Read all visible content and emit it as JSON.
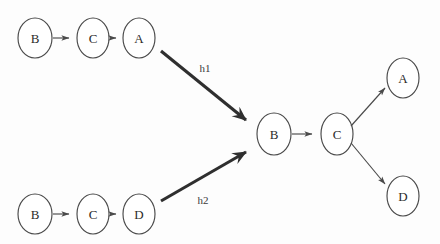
{
  "figure": {
    "background_color": "#fdfdfd",
    "stroke_color": "#4a4a4a",
    "thick_stroke_color": "#2f2f2f",
    "label_color": "#2b2b2b"
  },
  "graphs": {
    "source_top": {
      "name": "top-source-graph",
      "nodes": [
        {
          "id": "t1",
          "label": "B",
          "cx": 35,
          "cy": 38,
          "rx": 17,
          "ry": 20
        },
        {
          "id": "t2",
          "label": "C",
          "cx": 93,
          "cy": 38,
          "rx": 16,
          "ry": 20
        },
        {
          "id": "t3",
          "label": "A",
          "cx": 139,
          "cy": 38,
          "rx": 16,
          "ry": 20
        }
      ],
      "edges": [
        {
          "from": "t1",
          "to": "t2",
          "label": ""
        },
        {
          "from": "t2",
          "to": "t3",
          "label": ""
        }
      ]
    },
    "source_bottom": {
      "name": "bottom-source-graph",
      "nodes": [
        {
          "id": "b1",
          "label": "B",
          "cx": 35,
          "cy": 214,
          "rx": 17,
          "ry": 20
        },
        {
          "id": "b2",
          "label": "C",
          "cx": 93,
          "cy": 214,
          "rx": 16,
          "ry": 20
        },
        {
          "id": "b3",
          "label": "D",
          "cx": 139,
          "cy": 214,
          "rx": 16,
          "ry": 20
        }
      ],
      "edges": [
        {
          "from": "b1",
          "to": "b2",
          "label": ""
        },
        {
          "from": "b2",
          "to": "b3",
          "label": ""
        }
      ]
    },
    "result": {
      "name": "merged-result-graph",
      "nodes": [
        {
          "id": "r1",
          "label": "B",
          "cx": 274,
          "cy": 134,
          "rx": 17,
          "ry": 21
        },
        {
          "id": "r2",
          "label": "C",
          "cx": 337,
          "cy": 134,
          "rx": 16,
          "ry": 21
        },
        {
          "id": "r3",
          "label": "A",
          "cx": 403,
          "cy": 78,
          "rx": 16,
          "ry": 20
        },
        {
          "id": "r4",
          "label": "D",
          "cx": 403,
          "cy": 196,
          "rx": 16,
          "ry": 20
        }
      ],
      "edges": [
        {
          "from": "r1",
          "to": "r2",
          "label": ""
        },
        {
          "from": "r2",
          "to": "r3",
          "label": ""
        },
        {
          "from": "r2",
          "to": "r4",
          "label": ""
        }
      ]
    }
  },
  "mappings": [
    {
      "name": "mapping-h1",
      "label": "h1",
      "from_graph": "source_top",
      "to_graph": "result",
      "label_x": 205,
      "label_y": 68
    },
    {
      "name": "mapping-h2",
      "label": "h2",
      "from_graph": "source_bottom",
      "to_graph": "result",
      "label_x": 203,
      "label_y": 200
    }
  ]
}
